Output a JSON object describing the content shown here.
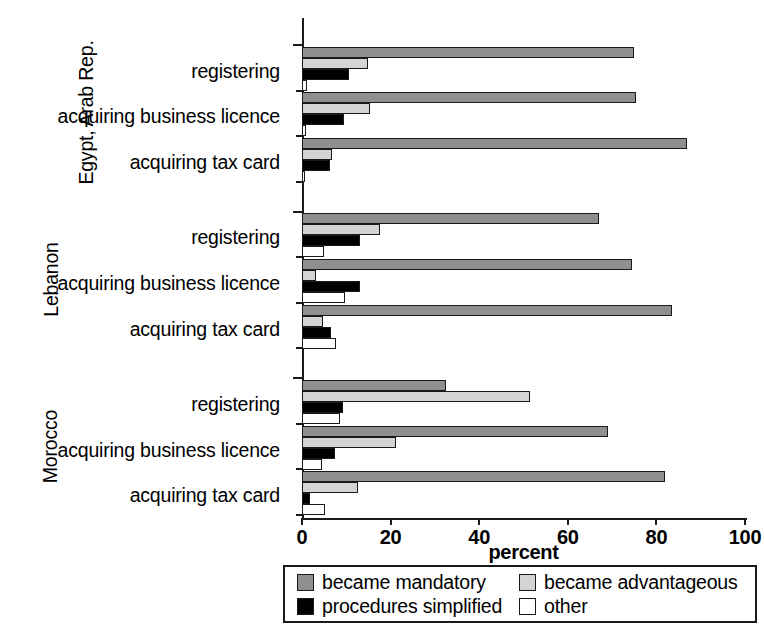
{
  "chart_data": {
    "type": "bar",
    "orientation": "horizontal",
    "title": "",
    "subtitle": "",
    "xlabel": "percent",
    "ylabel": "",
    "xlim": [
      0,
      100
    ],
    "xticks": [
      0,
      20,
      40,
      60,
      80,
      100
    ],
    "xtick_labels": [
      "0",
      "20",
      "40",
      "60",
      "80",
      "100"
    ],
    "grid": false,
    "legend_position": "bottom",
    "legend": [
      {
        "name": "became mandatory",
        "color": "#8f8f8f"
      },
      {
        "name": "became advantageous",
        "color": "#d4d4d4"
      },
      {
        "name": "procedures simplified",
        "color": "#000000"
      },
      {
        "name": "other",
        "color": "#ffffff"
      }
    ],
    "series": [
      {
        "name": "became mandatory",
        "key": "mandatory"
      },
      {
        "name": "became advantageous",
        "key": "advantageous"
      },
      {
        "name": "procedures simplified",
        "key": "simplified"
      },
      {
        "name": "other",
        "key": "other"
      }
    ],
    "groups": [
      {
        "label": "Egypt, Arab Rep.",
        "categories": [
          {
            "label": "registering",
            "values": {
              "mandatory": 75.0,
              "advantageous": 15.0,
              "simplified": 10.5,
              "other": 1.2
            }
          },
          {
            "label": "acquiring business licence",
            "values": {
              "mandatory": 75.5,
              "advantageous": 15.3,
              "simplified": 9.5,
              "other": 0.8
            }
          },
          {
            "label": "acquiring  tax card",
            "values": {
              "mandatory": 87.0,
              "advantageous": 6.8,
              "simplified": 6.3,
              "other": 0.6
            }
          }
        ]
      },
      {
        "label": "Lebanon",
        "categories": [
          {
            "label": "registering",
            "values": {
              "mandatory": 67.0,
              "advantageous": 17.5,
              "simplified": 13.0,
              "other": 5.0
            }
          },
          {
            "label": "acquiring business licence",
            "values": {
              "mandatory": 74.5,
              "advantageous": 3.2,
              "simplified": 13.0,
              "other": 9.7
            }
          },
          {
            "label": "acquiring  tax card",
            "values": {
              "mandatory": 83.5,
              "advantageous": 4.7,
              "simplified": 6.5,
              "other": 7.7
            }
          }
        ]
      },
      {
        "label": "Morocco",
        "categories": [
          {
            "label": "registering",
            "values": {
              "mandatory": 32.5,
              "advantageous": 51.5,
              "simplified": 9.3,
              "other": 8.6
            }
          },
          {
            "label": "acquiring business licence",
            "values": {
              "mandatory": 69.0,
              "advantageous": 21.2,
              "simplified": 7.4,
              "other": 4.5
            }
          },
          {
            "label": "acquiring  tax card",
            "values": {
              "mandatory": 82.0,
              "advantageous": 12.6,
              "simplified": 1.8,
              "other": 5.2
            }
          }
        ]
      }
    ]
  }
}
